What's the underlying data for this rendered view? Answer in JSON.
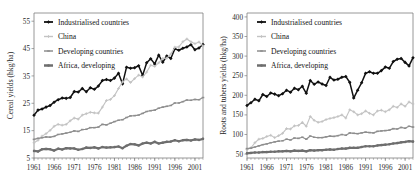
{
  "figure": {
    "background": "#ffffff",
    "panel_count": 2
  },
  "series_style": {
    "industrialised": {
      "color": "#111111",
      "marker": "diamond",
      "width": 1.5
    },
    "china": {
      "color": "#c3c3c3",
      "marker": "cross",
      "width": 1.1
    },
    "developing": {
      "color": "#8e8e8e",
      "marker": "bar",
      "width": 1.2
    },
    "africa": {
      "color": "#6e6e6e",
      "marker": "circle",
      "width": 2.2
    }
  },
  "legend": {
    "entries": [
      {
        "key": "industrialised",
        "label": "Industrialised countries"
      },
      {
        "key": "china",
        "label": "China"
      },
      {
        "key": "developing",
        "label": "Developing countries"
      },
      {
        "key": "africa",
        "label": "Africa, developing"
      }
    ]
  },
  "chart_data": [
    {
      "id": "cereal-yields",
      "type": "line",
      "title": "",
      "xlabel": "",
      "ylabel": "Cereal yields (hkg/ha)",
      "xlim": [
        1961,
        2003
      ],
      "ylim": [
        5,
        58
      ],
      "yticks": [
        5,
        15,
        25,
        35,
        45,
        55
      ],
      "xticks": [
        1961,
        1966,
        1971,
        1976,
        1981,
        1986,
        1991,
        1996,
        2001
      ],
      "grid": false,
      "legend_position": "top-left",
      "x": [
        1961,
        1962,
        1963,
        1964,
        1965,
        1966,
        1967,
        1968,
        1969,
        1970,
        1971,
        1972,
        1973,
        1974,
        1975,
        1976,
        1977,
        1978,
        1979,
        1980,
        1981,
        1982,
        1983,
        1984,
        1985,
        1986,
        1987,
        1988,
        1989,
        1990,
        1991,
        1992,
        1993,
        1994,
        1995,
        1996,
        1997,
        1998,
        1999,
        2000,
        2001,
        2002,
        2003
      ],
      "series": [
        {
          "name": "Industrialised countries",
          "key": "industrialised",
          "values": [
            20.6,
            22.5,
            22.9,
            23.6,
            24.2,
            25.4,
            26.3,
            26.9,
            26.8,
            27.1,
            29.3,
            29.1,
            30.4,
            29.2,
            30.7,
            30.1,
            31.3,
            33.3,
            33.7,
            33.3,
            34.2,
            36.0,
            32.1,
            38.2,
            37.8,
            38.0,
            38.7,
            35.2,
            39.8,
            41.3,
            39.4,
            42.6,
            40.0,
            42.3,
            41.4,
            44.9,
            44.4,
            45.1,
            45.6,
            46.4,
            44.6,
            45.2,
            46.5
          ]
        },
        {
          "name": "China",
          "key": "china",
          "values": [
            10.6,
            11.5,
            13.0,
            13.9,
            15.1,
            16.6,
            17.3,
            17.0,
            17.3,
            18.6,
            19.6,
            19.2,
            20.7,
            21.2,
            21.7,
            21.5,
            21.4,
            23.6,
            26.0,
            26.4,
            27.8,
            30.4,
            32.8,
            33.9,
            32.6,
            34.0,
            35.3,
            34.6,
            36.4,
            38.9,
            38.5,
            39.8,
            41.4,
            41.5,
            43.0,
            45.5,
            45.6,
            47.5,
            48.5,
            47.5,
            46.8,
            47.4,
            46.0
          ]
        },
        {
          "name": "Developing countries",
          "key": "developing",
          "values": [
            11.8,
            12.2,
            12.4,
            12.7,
            12.6,
            12.9,
            13.6,
            13.8,
            14.1,
            14.4,
            14.9,
            14.7,
            15.4,
            15.5,
            16.1,
            16.1,
            16.3,
            17.3,
            17.1,
            17.7,
            18.3,
            18.8,
            19.0,
            19.8,
            20.4,
            20.5,
            20.7,
            21.3,
            22.0,
            22.3,
            22.5,
            23.2,
            23.6,
            23.9,
            24.2,
            25.1,
            25.1,
            25.6,
            26.2,
            26.1,
            26.4,
            26.3,
            27.1
          ]
        },
        {
          "name": "Africa, developing",
          "key": "africa",
          "values": [
            7.6,
            7.4,
            8.2,
            8.3,
            8.2,
            7.7,
            8.4,
            8.1,
            8.6,
            8.5,
            8.5,
            8.0,
            8.3,
            8.8,
            8.7,
            8.9,
            8.5,
            9.0,
            8.8,
            8.9,
            9.0,
            9.2,
            8.6,
            9.5,
            10.1,
            10.0,
            9.6,
            10.3,
            10.6,
            10.3,
            10.9,
            10.3,
            10.6,
            10.9,
            11.0,
            11.5,
            11.1,
            11.5,
            11.6,
            11.4,
            11.8,
            11.6,
            12.0
          ]
        }
      ]
    },
    {
      "id": "roots-and-tubers-yields",
      "type": "line",
      "title": "",
      "xlabel": "",
      "ylabel": "Roots and tubers yields (hkg/ha)",
      "xlim": [
        1961,
        2003
      ],
      "ylim": [
        40,
        410
      ],
      "yticks": [
        50,
        100,
        150,
        200,
        250,
        300,
        350,
        400
      ],
      "xticks": [
        1961,
        1966,
        1971,
        1976,
        1981,
        1986,
        1991,
        1996,
        2001
      ],
      "grid": false,
      "legend_position": "top-left",
      "x": [
        1961,
        1962,
        1963,
        1964,
        1965,
        1966,
        1967,
        1968,
        1969,
        1970,
        1971,
        1972,
        1973,
        1974,
        1975,
        1976,
        1977,
        1978,
        1979,
        1980,
        1981,
        1982,
        1983,
        1984,
        1985,
        1986,
        1987,
        1988,
        1989,
        1990,
        1991,
        1992,
        1993,
        1994,
        1995,
        1996,
        1997,
        1998,
        1999,
        2000,
        2001,
        2002,
        2003
      ],
      "series": [
        {
          "name": "Industrialised countries",
          "key": "industrialised",
          "values": [
            174,
            181,
            190,
            186,
            202,
            197,
            206,
            203,
            199,
            204,
            213,
            208,
            218,
            214,
            223,
            205,
            238,
            228,
            234,
            229,
            225,
            246,
            239,
            241,
            246,
            248,
            233,
            193,
            213,
            232,
            256,
            260,
            256,
            256,
            263,
            272,
            269,
            286,
            292,
            294,
            284,
            275,
            296,
            308,
            304
          ]
        },
        {
          "name": "China",
          "key": "china",
          "values": [
            62,
            66,
            79,
            88,
            90,
            95,
            98,
            92,
            97,
            103,
            115,
            114,
            122,
            123,
            131,
            121,
            146,
            136,
            131,
            133,
            138,
            141,
            143,
            146,
            150,
            142,
            163,
            158,
            150,
            153,
            160,
            154,
            150,
            160,
            162,
            158,
            163,
            172,
            169,
            178,
            172,
            183,
            178,
            181,
            172
          ]
        },
        {
          "name": "Developing countries",
          "key": "developing",
          "values": [
            64,
            65,
            68,
            71,
            74,
            76,
            79,
            81,
            83,
            84,
            88,
            86,
            91,
            90,
            93,
            88,
            96,
            93,
            92,
            92,
            94,
            96,
            95,
            97,
            100,
            98,
            104,
            103,
            102,
            104,
            106,
            105,
            104,
            108,
            109,
            110,
            111,
            115,
            114,
            118,
            116,
            121,
            119,
            118,
            117
          ]
        },
        {
          "name": "Africa, developing",
          "key": "africa",
          "values": [
            52,
            53,
            54,
            54,
            55,
            55,
            56,
            56,
            57,
            57,
            58,
            57,
            59,
            58,
            59,
            57,
            60,
            59,
            60,
            60,
            61,
            62,
            61,
            63,
            64,
            64,
            66,
            66,
            66,
            68,
            70,
            70,
            70,
            72,
            73,
            74,
            75,
            77,
            78,
            80,
            81,
            83,
            82,
            83,
            82
          ]
        }
      ]
    }
  ]
}
